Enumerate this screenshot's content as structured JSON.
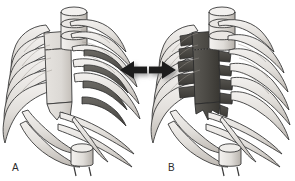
{
  "figure": {
    "type": "anatomical-illustration",
    "view": "anterolateral oblique",
    "background_color": "#ffffff",
    "width": 295,
    "height": 181,
    "panel_count": 2
  },
  "palette": {
    "bone_light": "#e8e6e3",
    "bone_mid": "#cfcbc6",
    "bone_shadow": "#b3aea8",
    "bone_deep_shadow": "#8e8a85",
    "outline": "#3a3a3a",
    "highlight_dark": "#55534f",
    "highlight_dark_alt": "#474540",
    "sternum_light": "#dcd9d5",
    "arrow_fill": "#1c1c1c",
    "arrow_shadow": "#9a9a9a",
    "label_color": "#2b2b2b"
  },
  "panels": [
    {
      "id": "panel-a",
      "label": "A",
      "label_x": 12,
      "label_y": 167,
      "highlight_region": "posterior rib shafts",
      "highlight_color": "#55534f",
      "highlight_side": "left lateral (image right)",
      "sternum_color": "#dcd9d5",
      "sternum_shaded": false,
      "highlighted_rib_count": 4,
      "rib_pair_count": 10,
      "vertebrae_visible": 3
    },
    {
      "id": "panel-b",
      "label": "B",
      "label_x": 168,
      "label_y": 167,
      "highlight_region": "sternum and costal cartilages",
      "highlight_color": "#4a4843",
      "highlight_side": "anterior midline",
      "sternum_color": "#4a4843",
      "sternum_shaded": true,
      "highlighted_cartilage_count": 6,
      "rib_pair_count": 10,
      "vertebrae_visible": 3
    }
  ],
  "arrows": [
    {
      "id": "arrow-left",
      "direction": "left",
      "points_to": "panel-a",
      "tip_x": 120,
      "tip_y": 70,
      "tail_x": 148,
      "length": 28,
      "color": "#1c1c1c",
      "has_drop_shadow": true
    },
    {
      "id": "arrow-right",
      "direction": "right",
      "points_to": "panel-b",
      "tip_x": 175,
      "tip_y": 70,
      "tail_x": 148,
      "length": 27,
      "color": "#1c1c1c",
      "has_drop_shadow": true
    }
  ],
  "labels": {
    "panel_a": "A",
    "panel_b": "B"
  }
}
